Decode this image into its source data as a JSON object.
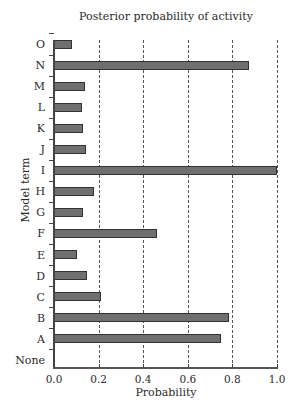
{
  "chart_data": {
    "type": "bar",
    "orientation": "horizontal",
    "title": "Posterior probability of activity",
    "xlabel": "Probability",
    "ylabel": "Model term",
    "xlim": [
      0.0,
      1.0
    ],
    "xticks": [
      "0.0",
      "0.2",
      "0.4",
      "0.6",
      "0.8",
      "1.0"
    ],
    "grid": "vertical dashed at 0.2, 0.4, 0.6, 0.8, 1.0",
    "legend": null,
    "categories": [
      "O",
      "N",
      "M",
      "L",
      "K",
      "J",
      "I",
      "H",
      "G",
      "F",
      "E",
      "D",
      "C",
      "B",
      "A",
      "None"
    ],
    "values": [
      0.08,
      0.875,
      0.14,
      0.125,
      0.13,
      0.145,
      1.0,
      0.18,
      0.13,
      0.46,
      0.105,
      0.15,
      0.21,
      0.785,
      0.75,
      0.0
    ]
  }
}
